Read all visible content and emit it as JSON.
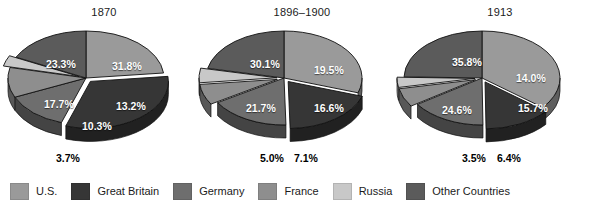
{
  "chart_data": {
    "type": "pie",
    "title": "",
    "subtitle": "",
    "layout": {
      "panels": 3,
      "three_d": true,
      "grid": false,
      "legend_position": "bottom",
      "label_format": "percent_one_decimal",
      "inside_label_color": "#ffffff",
      "outside_label_color": "#000000"
    },
    "categories": [
      "U.S.",
      "Great Britain",
      "Germany",
      "France",
      "Russia",
      "Other Countries"
    ],
    "colors": {
      "U.S.": "#9a9a9a",
      "Great Britain": "#363636",
      "Germany": "#6e6e6e",
      "France": "#8e8e8e",
      "Russia": "#c8c8c8",
      "Other Countries": "#5b5b5b"
    },
    "panels": [
      {
        "title": "1870",
        "values": [
          23.3,
          31.8,
          13.2,
          10.3,
          3.7,
          17.7
        ],
        "labels": [
          "23.3%",
          "31.8%",
          "13.2%",
          "10.3%",
          "3.7%",
          "17.7%"
        ],
        "exploded": [
          "Great Britain",
          "Russia"
        ],
        "outside_labels": [
          "3.7%"
        ]
      },
      {
        "title": "1896–1900",
        "values": [
          30.1,
          19.5,
          16.6,
          7.1,
          5.0,
          21.7
        ],
        "labels": [
          "30.1%",
          "19.5%",
          "16.6%",
          "7.1%",
          "5.0%",
          "21.7%"
        ],
        "exploded": [
          "Great Britain",
          "France",
          "Russia"
        ],
        "outside_labels": [
          "5.0%",
          "7.1%"
        ]
      },
      {
        "title": "1913",
        "values": [
          35.8,
          14.0,
          15.7,
          6.4,
          3.5,
          24.6
        ],
        "labels": [
          "35.8%",
          "14.0%",
          "15.7%",
          "6.4%",
          "3.5%",
          "24.6%"
        ],
        "exploded": [
          "Great Britain",
          "France",
          "Russia"
        ],
        "outside_labels": [
          "3.5%",
          "6.4%"
        ]
      }
    ]
  },
  "panels": [
    {
      "id": "p1870",
      "title": "1870",
      "inside": [
        {
          "text": "23.3%",
          "x": 42,
          "y": 36
        },
        {
          "text": "31.8%",
          "x": 108,
          "y": 38
        },
        {
          "text": "13.2%",
          "x": 112,
          "y": 78
        },
        {
          "text": "10.3%",
          "x": 78,
          "y": 98
        },
        {
          "text": "17.7%",
          "x": 40,
          "y": 76
        }
      ],
      "outside": [
        {
          "text": "3.7%",
          "x": 52,
          "y": 152
        }
      ]
    },
    {
      "id": "p1896",
      "title": "1896–1900",
      "inside": [
        {
          "text": "30.1%",
          "x": 48,
          "y": 36
        },
        {
          "text": "19.5%",
          "x": 112,
          "y": 42
        },
        {
          "text": "16.6%",
          "x": 112,
          "y": 80
        },
        {
          "text": "21.7%",
          "x": 44,
          "y": 80
        }
      ],
      "outside": [
        {
          "text": "5.0%",
          "x": 58,
          "y": 152
        },
        {
          "text": "7.1%",
          "x": 92,
          "y": 152
        }
      ]
    },
    {
      "id": "p1913",
      "title": "1913",
      "inside": [
        {
          "text": "35.8%",
          "x": 52,
          "y": 34
        },
        {
          "text": "14.0%",
          "x": 116,
          "y": 50
        },
        {
          "text": "15.7%",
          "x": 118,
          "y": 80
        },
        {
          "text": "24.6%",
          "x": 42,
          "y": 82
        }
      ],
      "outside": [
        {
          "text": "3.5%",
          "x": 62,
          "y": 152
        },
        {
          "text": "6.4%",
          "x": 97,
          "y": 152
        }
      ]
    }
  ],
  "legend": {
    "items": [
      {
        "label": "U.S.",
        "color": "#9a9a9a"
      },
      {
        "label": "Great Britain",
        "color": "#363636"
      },
      {
        "label": "Germany",
        "color": "#6e6e6e"
      },
      {
        "label": "France",
        "color": "#8e8e8e"
      },
      {
        "label": "Russia",
        "color": "#c8c8c8"
      },
      {
        "label": "Other Countries",
        "color": "#5b5b5b"
      }
    ]
  }
}
